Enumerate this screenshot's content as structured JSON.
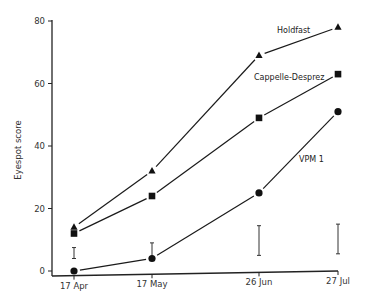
{
  "chart_data": {
    "type": "line",
    "title": "",
    "xlabel": "",
    "ylabel": "Eyespot score",
    "ylim": [
      0,
      80
    ],
    "yticks": [
      0,
      20,
      40,
      60,
      80
    ],
    "categories": [
      "17 Apr",
      "17 May",
      "26 Jun",
      "27 Jul"
    ],
    "grid": false,
    "legend": "inline labels near lines",
    "series": [
      {
        "name": "Holdfast",
        "marker": "triangle",
        "values": [
          14,
          32,
          69,
          78
        ]
      },
      {
        "name": "Cappelle-Desprez",
        "marker": "square",
        "values": [
          12,
          24,
          49,
          63
        ]
      },
      {
        "name": "VPM 1",
        "marker": "circle",
        "values": [
          0,
          4,
          25,
          51
        ]
      }
    ],
    "error_bars": [
      {
        "x": "17 Apr",
        "low": 4,
        "high": 7.5
      },
      {
        "x": "17 May",
        "low": 4,
        "high": 9
      },
      {
        "x": "26 Jun",
        "low": 5,
        "high": 14.5
      },
      {
        "x": "27 Jul",
        "low": 5.5,
        "high": 15
      }
    ],
    "colors": {
      "line": "#1a1a1a",
      "marker": "#111111",
      "axis": "#222222"
    }
  }
}
